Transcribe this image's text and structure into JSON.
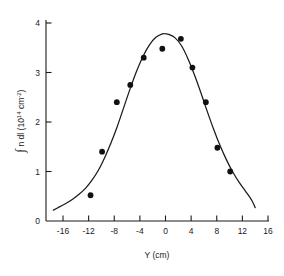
{
  "chart_data": {
    "type": "scatter",
    "title": "",
    "subtitle": "",
    "xlabel": "Y (cm)",
    "ylabel": "∫ n dl  (10¹⁴ cm⁻²)",
    "ylabel_parts": {
      "integral": "∫",
      "integrand": "n dl",
      "units_open": "(10",
      "units_exp1": "14",
      "units_mid": " cm",
      "units_exp2": "-2",
      "units_close": ")"
    },
    "xlim": [
      -18,
      16
    ],
    "ylim": [
      0,
      4
    ],
    "xticks": [
      -16,
      -12,
      -8,
      -4,
      0,
      4,
      8,
      12,
      16
    ],
    "xtick_labels": [
      "-16",
      "-12",
      "-8",
      "-4",
      "0",
      "4",
      "8",
      "12",
      "16"
    ],
    "yticks": [
      0,
      1,
      2,
      3,
      4
    ],
    "ytick_labels": [
      "0",
      "1",
      "2",
      "3",
      "4"
    ],
    "grid": false,
    "legend": "none",
    "tick_direction": "in",
    "axes_spines": [
      "left",
      "bottom"
    ],
    "marker": "filled-circle",
    "marker_color": "#111111",
    "curve_color": "#1a1a1a",
    "series": [
      {
        "name": "measured line density",
        "kind": "points",
        "x": [
          -11.7,
          -9.9,
          -7.6,
          -5.5,
          -3.4,
          -0.5,
          2.4,
          4.2,
          6.3,
          8.1,
          10.1
        ],
        "y": [
          0.52,
          1.4,
          2.4,
          2.75,
          3.3,
          3.48,
          3.68,
          3.1,
          2.4,
          1.48,
          1.0
        ]
      },
      {
        "name": "fitted profile",
        "kind": "curve",
        "x": [
          -17.5,
          -16.5,
          -15.5,
          -14.5,
          -13.5,
          -12.5,
          -11.5,
          -10.5,
          -9.5,
          -8.5,
          -7.5,
          -6.5,
          -5.5,
          -4.5,
          -3.5,
          -2.5,
          -1.5,
          -0.5,
          0.0,
          0.5,
          1.5,
          2.5,
          3.5,
          4.5,
          5.5,
          6.5,
          7.5,
          8.5,
          9.5,
          10.5,
          11.5,
          12.5,
          13.5,
          14.0
        ],
        "y": [
          0.22,
          0.29,
          0.36,
          0.44,
          0.54,
          0.66,
          0.82,
          1.02,
          1.28,
          1.58,
          1.92,
          2.3,
          2.68,
          3.03,
          3.33,
          3.56,
          3.71,
          3.78,
          3.78,
          3.77,
          3.7,
          3.54,
          3.28,
          2.96,
          2.6,
          2.22,
          1.86,
          1.53,
          1.24,
          0.99,
          0.78,
          0.6,
          0.41,
          0.27
        ]
      }
    ]
  },
  "figure": {
    "caption": "",
    "background": "#ffffff"
  }
}
